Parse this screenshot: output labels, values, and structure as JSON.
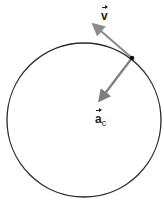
{
  "diagram": {
    "circle": {
      "cx": 84,
      "cy": 120,
      "r": 77,
      "stroke": "#2b2b2b"
    },
    "point": {
      "x": 132,
      "y": 58,
      "color": "#111111"
    },
    "velocity": {
      "label": "v",
      "tip": {
        "x": 90,
        "y": 22
      },
      "color": "#8c8c8c"
    },
    "acceleration": {
      "label": "a",
      "subscript": "c",
      "tip": {
        "x": 97,
        "y": 104
      },
      "color": "#7d7d7d"
    }
  }
}
